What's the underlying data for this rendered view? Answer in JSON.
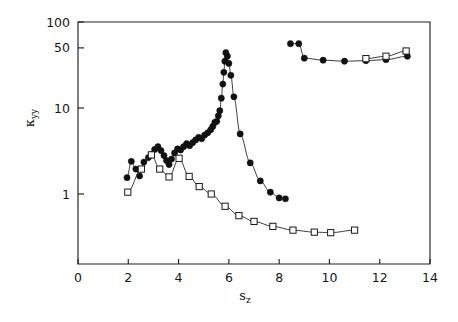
{
  "chart_data": {
    "type": "scatter",
    "title": "",
    "subtitle": "",
    "xlabel": "s_z",
    "xlabel_base": "s",
    "xlabel_sub": "z",
    "ylabel": "κ_yy",
    "ylabel_base": "κ",
    "ylabel_sub": "yy",
    "xlim": [
      0,
      14
    ],
    "ylim": [
      0.2,
      100
    ],
    "yscale": "log",
    "xscale": "linear",
    "grid": false,
    "legend": null,
    "legend_position": "none",
    "xticks": [
      0,
      2,
      4,
      6,
      8,
      10,
      12,
      14
    ],
    "xticklabels": [
      "0",
      "2",
      "4",
      "6",
      "8",
      "10",
      "12",
      "14"
    ],
    "yticks": [
      1,
      10,
      50,
      100
    ],
    "yticklabels": [
      "1",
      "10",
      "50",
      "100"
    ],
    "frame": "box",
    "series": [
      {
        "name": "filled-circle-lower-left-branch",
        "marker": "filled-circle",
        "color": "#111111",
        "connected": true,
        "points": [
          [
            1.95,
            1.55
          ],
          [
            2.12,
            2.4
          ],
          [
            2.3,
            1.95
          ],
          [
            2.45,
            1.62
          ],
          [
            2.62,
            2.35
          ],
          [
            2.8,
            2.65
          ],
          [
            2.92,
            2.9
          ],
          [
            3.05,
            3.3
          ],
          [
            3.18,
            3.55
          ],
          [
            3.3,
            3.2
          ],
          [
            3.42,
            2.8
          ],
          [
            3.52,
            2.45
          ],
          [
            3.62,
            2.2
          ],
          [
            3.72,
            2.55
          ],
          [
            3.84,
            3.0
          ],
          [
            3.96,
            3.35
          ],
          [
            4.08,
            3.25
          ],
          [
            4.2,
            3.55
          ],
          [
            4.32,
            3.85
          ],
          [
            4.44,
            3.65
          ],
          [
            4.56,
            3.95
          ],
          [
            4.68,
            4.25
          ],
          [
            4.8,
            4.55
          ],
          [
            4.92,
            4.4
          ],
          [
            5.04,
            4.85
          ],
          [
            5.16,
            5.15
          ],
          [
            5.28,
            5.6
          ],
          [
            5.36,
            6.1
          ],
          [
            5.44,
            6.8
          ],
          [
            5.52,
            7.0
          ],
          [
            5.58,
            8.1
          ],
          [
            5.64,
            9.3
          ],
          [
            5.7,
            13.0
          ],
          [
            5.76,
            19.0
          ],
          [
            5.8,
            26.0
          ],
          [
            5.84,
            35.0
          ],
          [
            5.88,
            44.0
          ],
          [
            5.94,
            40.0
          ],
          [
            6.0,
            33.0
          ],
          [
            6.08,
            24.0
          ],
          [
            6.2,
            13.5
          ],
          [
            6.45,
            5.0
          ],
          [
            6.85,
            2.3
          ],
          [
            7.25,
            1.42
          ],
          [
            7.65,
            1.05
          ],
          [
            8.0,
            0.9
          ],
          [
            8.25,
            0.88
          ]
        ]
      },
      {
        "name": "open-square-lower-left-branch",
        "marker": "open-square",
        "color": "#1a1a1a",
        "connected": true,
        "points": [
          [
            1.98,
            1.05
          ],
          [
            2.52,
            1.95
          ],
          [
            2.92,
            2.85
          ],
          [
            3.25,
            1.95
          ],
          [
            3.62,
            1.58
          ],
          [
            4.02,
            2.6
          ],
          [
            4.42,
            1.6
          ],
          [
            4.82,
            1.22
          ],
          [
            5.3,
            1.0
          ],
          [
            5.85,
            0.72
          ],
          [
            6.4,
            0.56
          ],
          [
            7.0,
            0.48
          ],
          [
            7.75,
            0.42
          ],
          [
            8.55,
            0.38
          ],
          [
            9.4,
            0.36
          ],
          [
            10.05,
            0.355
          ],
          [
            11.0,
            0.38
          ]
        ]
      },
      {
        "name": "filled-circle-upper-right-branch",
        "marker": "filled-circle",
        "color": "#111111",
        "connected": true,
        "points": [
          [
            8.45,
            56.0
          ],
          [
            8.78,
            56.0
          ],
          [
            9.0,
            38.0
          ],
          [
            9.75,
            36.0
          ],
          [
            10.6,
            35.0
          ],
          [
            11.45,
            35.5
          ],
          [
            12.25,
            36.5
          ],
          [
            13.1,
            40.0
          ]
        ]
      },
      {
        "name": "open-square-upper-right-branch",
        "marker": "open-square",
        "color": "#1a1a1a",
        "connected": true,
        "points": [
          [
            11.45,
            37.5
          ],
          [
            12.25,
            40.0
          ],
          [
            13.05,
            46.0
          ]
        ]
      }
    ]
  }
}
